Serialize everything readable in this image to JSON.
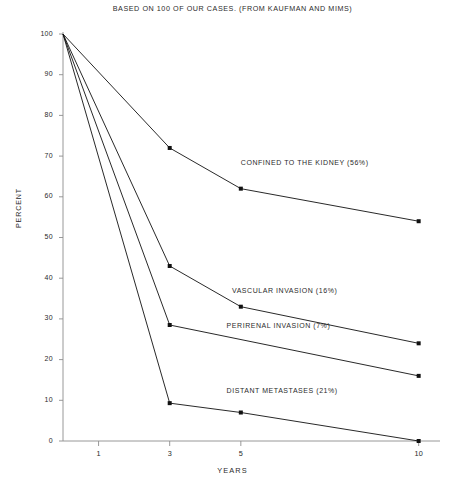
{
  "chart_data": {
    "type": "line",
    "title": "BASED ON 100 OF OUR CASES.  (FROM KAUFMAN AND MIMS)",
    "xlabel": "YEARS",
    "ylabel": "PERCENT",
    "xlim": [
      0,
      10.6
    ],
    "ylim": [
      0,
      100
    ],
    "grid": false,
    "legend_position": "inline-annotations",
    "x_ticks": [
      1,
      3,
      5,
      10
    ],
    "x_tick_labels": [
      "1",
      "3",
      "5",
      "10"
    ],
    "y_ticks": [
      0,
      10,
      20,
      30,
      40,
      50,
      60,
      70,
      80,
      90,
      100
    ],
    "y_tick_labels": [
      "0",
      "10",
      "20",
      "30",
      "40",
      "50",
      "60",
      "70",
      "80",
      "90",
      "100"
    ],
    "series": [
      {
        "name": "CONFINED TO THE KIDNEY (56%)",
        "label": "CONFINED TO THE KIDNEY (56%)",
        "label_x": 5.0,
        "label_y": 68,
        "x": [
          0,
          3,
          5,
          10
        ],
        "values": [
          100,
          72,
          62,
          54
        ]
      },
      {
        "name": "VASCULAR INVASION (16%)",
        "label": "VASCULAR INVASION (16%)",
        "label_x": 4.75,
        "label_y": 36.5,
        "x": [
          0,
          3,
          5,
          10
        ],
        "values": [
          100,
          43,
          33,
          24
        ]
      },
      {
        "name": "PERIRENAL INVASION (7%)",
        "label": "PERIRENAL INVASION (7%)",
        "label_x": 4.6,
        "label_y": 28,
        "x": [
          0,
          3,
          10
        ],
        "values": [
          100,
          28.5,
          16
        ]
      },
      {
        "name": "DISTANT METASTASES (21%)",
        "label": "DISTANT METASTASES (21%)",
        "label_x": 4.6,
        "label_y": 12,
        "x": [
          0,
          3,
          5,
          10
        ],
        "values": [
          100,
          9.3,
          7,
          0
        ]
      }
    ]
  },
  "colors": {
    "line": "#111111",
    "axis": "#8d8d8d",
    "text": "#2b2b2b",
    "background": "#ffffff"
  },
  "axes": {
    "plot_left_px": 63,
    "plot_right_px": 440,
    "plot_top_px": 34,
    "plot_bottom_px": 441
  }
}
